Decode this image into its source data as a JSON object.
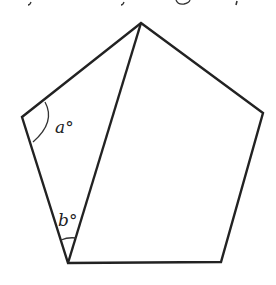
{
  "figure": {
    "stroke_color": "#222222",
    "vertices": {
      "top": [
        141,
        23
      ],
      "right": [
        263,
        113
      ],
      "bottom_right": [
        221,
        262
      ],
      "bottom_left": [
        68,
        263
      ],
      "left": [
        22,
        117
      ]
    },
    "angle_labels": {
      "a": "a°",
      "b": "b°"
    }
  }
}
